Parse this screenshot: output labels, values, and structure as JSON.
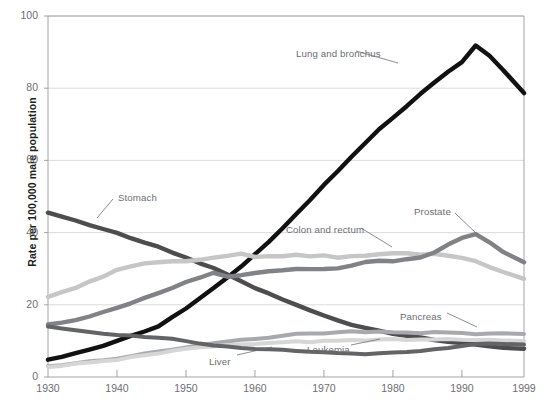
{
  "figure": {
    "ylabel": "Rate per 100,000 male population"
  },
  "chart_data": {
    "type": "line",
    "title": "",
    "xlabel": "",
    "ylabel": "Rate per 100,000 male population",
    "xlim": [
      1930,
      1999
    ],
    "ylim": [
      0,
      100
    ],
    "grid": true,
    "legend_position": "inline-annotations",
    "yticks": [
      0,
      20,
      40,
      60,
      80,
      100
    ],
    "xticks": [
      1930,
      1940,
      1950,
      1960,
      1970,
      1980,
      1990,
      1999
    ],
    "x": [
      1930,
      1932,
      1934,
      1936,
      1938,
      1940,
      1942,
      1944,
      1946,
      1948,
      1950,
      1952,
      1954,
      1956,
      1958,
      1960,
      1962,
      1964,
      1966,
      1968,
      1970,
      1972,
      1974,
      1976,
      1978,
      1980,
      1982,
      1984,
      1986,
      1988,
      1990,
      1992,
      1994,
      1996,
      1999
    ],
    "series": [
      {
        "name": "Lung and bronchus",
        "color": "#111111",
        "width": 4.4,
        "label_x": 296,
        "label_y": 48,
        "values": [
          4.8,
          5.6,
          6.6,
          7.6,
          8.6,
          10.0,
          11.4,
          12.6,
          14.0,
          16.6,
          19.0,
          21.8,
          24.6,
          27.6,
          30.6,
          34.0,
          37.4,
          41.2,
          45.2,
          49.0,
          53.2,
          57.0,
          61.0,
          64.8,
          68.6,
          71.8,
          75.0,
          78.4,
          81.6,
          84.6,
          87.2,
          91.8,
          89.0,
          85.0,
          78.6
        ]
      },
      {
        "name": "Stomach",
        "color": "#4d4d4f",
        "width": 4.4,
        "label_x": 118,
        "label_y": 192,
        "values": [
          45.6,
          44.4,
          43.4,
          42.2,
          41.0,
          39.8,
          38.4,
          37.2,
          36.0,
          34.4,
          33.2,
          31.6,
          30.2,
          28.4,
          26.6,
          24.6,
          23.0,
          21.4,
          20.0,
          18.4,
          17.0,
          15.8,
          14.6,
          13.6,
          12.8,
          12.0,
          11.4,
          10.8,
          10.2,
          9.8,
          9.4,
          9.0,
          8.6,
          8.2,
          7.8
        ]
      },
      {
        "name": "Colon and rectum",
        "color": "#c6c6c6",
        "width": 4.4,
        "label_x": 286,
        "label_y": 224,
        "values": [
          22.2,
          23.4,
          24.8,
          26.4,
          27.8,
          29.6,
          30.8,
          31.4,
          31.8,
          32.0,
          32.2,
          32.4,
          33.0,
          33.6,
          34.2,
          33.2,
          33.4,
          33.6,
          33.8,
          33.4,
          33.6,
          33.2,
          33.4,
          33.6,
          34.0,
          34.4,
          34.2,
          33.8,
          34.2,
          33.6,
          33.0,
          32.0,
          30.6,
          29.0,
          27.2
        ]
      },
      {
        "name": "Prostate",
        "color": "#808285",
        "width": 4.4,
        "label_x": 414,
        "label_y": 206,
        "values": [
          14.4,
          15.0,
          15.8,
          16.8,
          18.0,
          19.2,
          20.4,
          21.8,
          23.2,
          24.8,
          26.4,
          27.4,
          28.8,
          27.8,
          28.2,
          28.8,
          29.4,
          29.6,
          29.8,
          29.8,
          30.0,
          30.2,
          30.8,
          31.8,
          32.2,
          32.0,
          32.6,
          33.2,
          34.6,
          36.6,
          38.4,
          39.6,
          37.4,
          34.6,
          31.8
        ]
      },
      {
        "name": "Pancreas",
        "color": "#a7a9ac",
        "width": 4.0,
        "label_x": 400,
        "label_y": 311,
        "values": [
          3.0,
          3.4,
          3.8,
          4.2,
          4.6,
          5.2,
          5.8,
          6.4,
          7.0,
          7.6,
          8.2,
          8.8,
          9.4,
          9.8,
          10.2,
          10.6,
          11.0,
          11.4,
          11.8,
          12.0,
          12.2,
          12.4,
          12.6,
          12.4,
          12.6,
          12.4,
          12.4,
          12.2,
          12.4,
          12.2,
          12.2,
          12.0,
          12.0,
          12.0,
          11.9
        ]
      },
      {
        "name": "Leukemia",
        "color": "#d6d6d6",
        "width": 4.0,
        "label_x": 307,
        "label_y": 344,
        "values": [
          2.8,
          3.2,
          3.6,
          4.0,
          4.4,
          4.8,
          5.4,
          6.0,
          6.6,
          7.2,
          7.8,
          8.2,
          8.6,
          8.8,
          9.0,
          9.2,
          9.4,
          9.6,
          9.8,
          9.8,
          10.0,
          10.0,
          10.2,
          10.2,
          10.4,
          10.4,
          10.4,
          10.4,
          10.4,
          10.4,
          10.4,
          10.3,
          10.2,
          10.2,
          10.0
        ]
      },
      {
        "name": "Liver",
        "color": "#636466",
        "width": 4.0,
        "label_x": 209,
        "label_y": 356,
        "values": [
          14.0,
          13.4,
          12.8,
          12.4,
          12.0,
          11.6,
          11.4,
          11.2,
          11.0,
          10.6,
          10.0,
          9.4,
          8.8,
          8.4,
          8.0,
          7.8,
          7.6,
          7.4,
          7.2,
          7.0,
          6.8,
          6.6,
          6.6,
          6.4,
          6.6,
          6.8,
          7.0,
          7.2,
          7.6,
          8.0,
          8.6,
          9.0,
          9.2,
          9.2,
          9.0
        ]
      }
    ],
    "leaders": [
      {
        "name": "lung-leader",
        "x1": 356,
        "y1": 51,
        "x2": 398,
        "y2": 63
      },
      {
        "name": "stomach-leader",
        "x1": 113,
        "y1": 199,
        "x2": 97,
        "y2": 218
      },
      {
        "name": "colon-leader",
        "x1": 361,
        "y1": 228,
        "x2": 392,
        "y2": 247
      },
      {
        "name": "prostate-leader",
        "x1": 455,
        "y1": 213,
        "x2": 478,
        "y2": 235
      },
      {
        "name": "pancreas-leader",
        "x1": 447,
        "y1": 313,
        "x2": 477,
        "y2": 327
      },
      {
        "name": "leukemia-leader",
        "x1": 351,
        "y1": 345,
        "x2": 380,
        "y2": 339
      },
      {
        "name": "liver-leader",
        "x1": 237,
        "y1": 355,
        "x2": 272,
        "y2": 347
      }
    ]
  }
}
